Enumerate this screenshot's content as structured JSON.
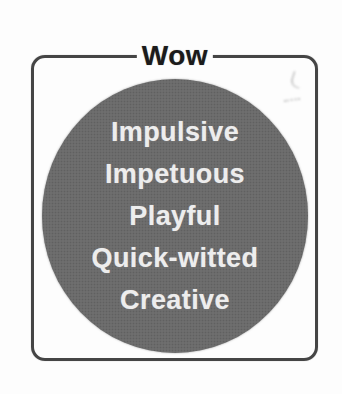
{
  "diagram": {
    "title": "Wow",
    "traits": [
      "Impulsive",
      "Impetuous",
      "Playful",
      "Quick-witted",
      "Creative"
    ],
    "colors": {
      "background": "#fdfdfd",
      "frame_border": "#454545",
      "title_text": "#1b1b1b",
      "circle_fill": "#6e6e6e",
      "trait_text": "#ededed",
      "artifact": "#8c8c8c"
    }
  }
}
